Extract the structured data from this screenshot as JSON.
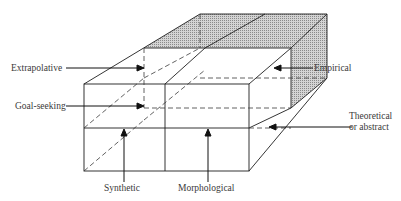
{
  "diagram": {
    "type": "3d-box-classification",
    "colors": {
      "line": "#1e1e1e",
      "shade": "#b8b8b8",
      "background": "#ffffff",
      "text": "#3a3a3a"
    },
    "labels": {
      "extrapolative": "Extrapolative",
      "goal_seeking": "Goal-seeking",
      "empirical": "Empirical",
      "theoretical_line1": "Theoretical",
      "theoretical_line2": "or abstract",
      "synthetic": "Synthetic",
      "morphological": "Morphological"
    }
  }
}
